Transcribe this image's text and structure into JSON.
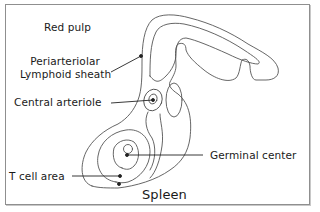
{
  "diagram": {
    "title": "Spleen",
    "labels": {
      "red_pulp": "Red pulp",
      "pals_line1": "Periarteriolar",
      "pals_line2": "Lymphoid sheath",
      "central_arteriole": "Central arteriole",
      "germinal_center": "Germinal center",
      "t_cell_area": "T cell area"
    },
    "colors": {
      "outline": "#555555",
      "leader": "#222222",
      "frame": "#8f8f8f",
      "background": "#ffffff"
    }
  }
}
